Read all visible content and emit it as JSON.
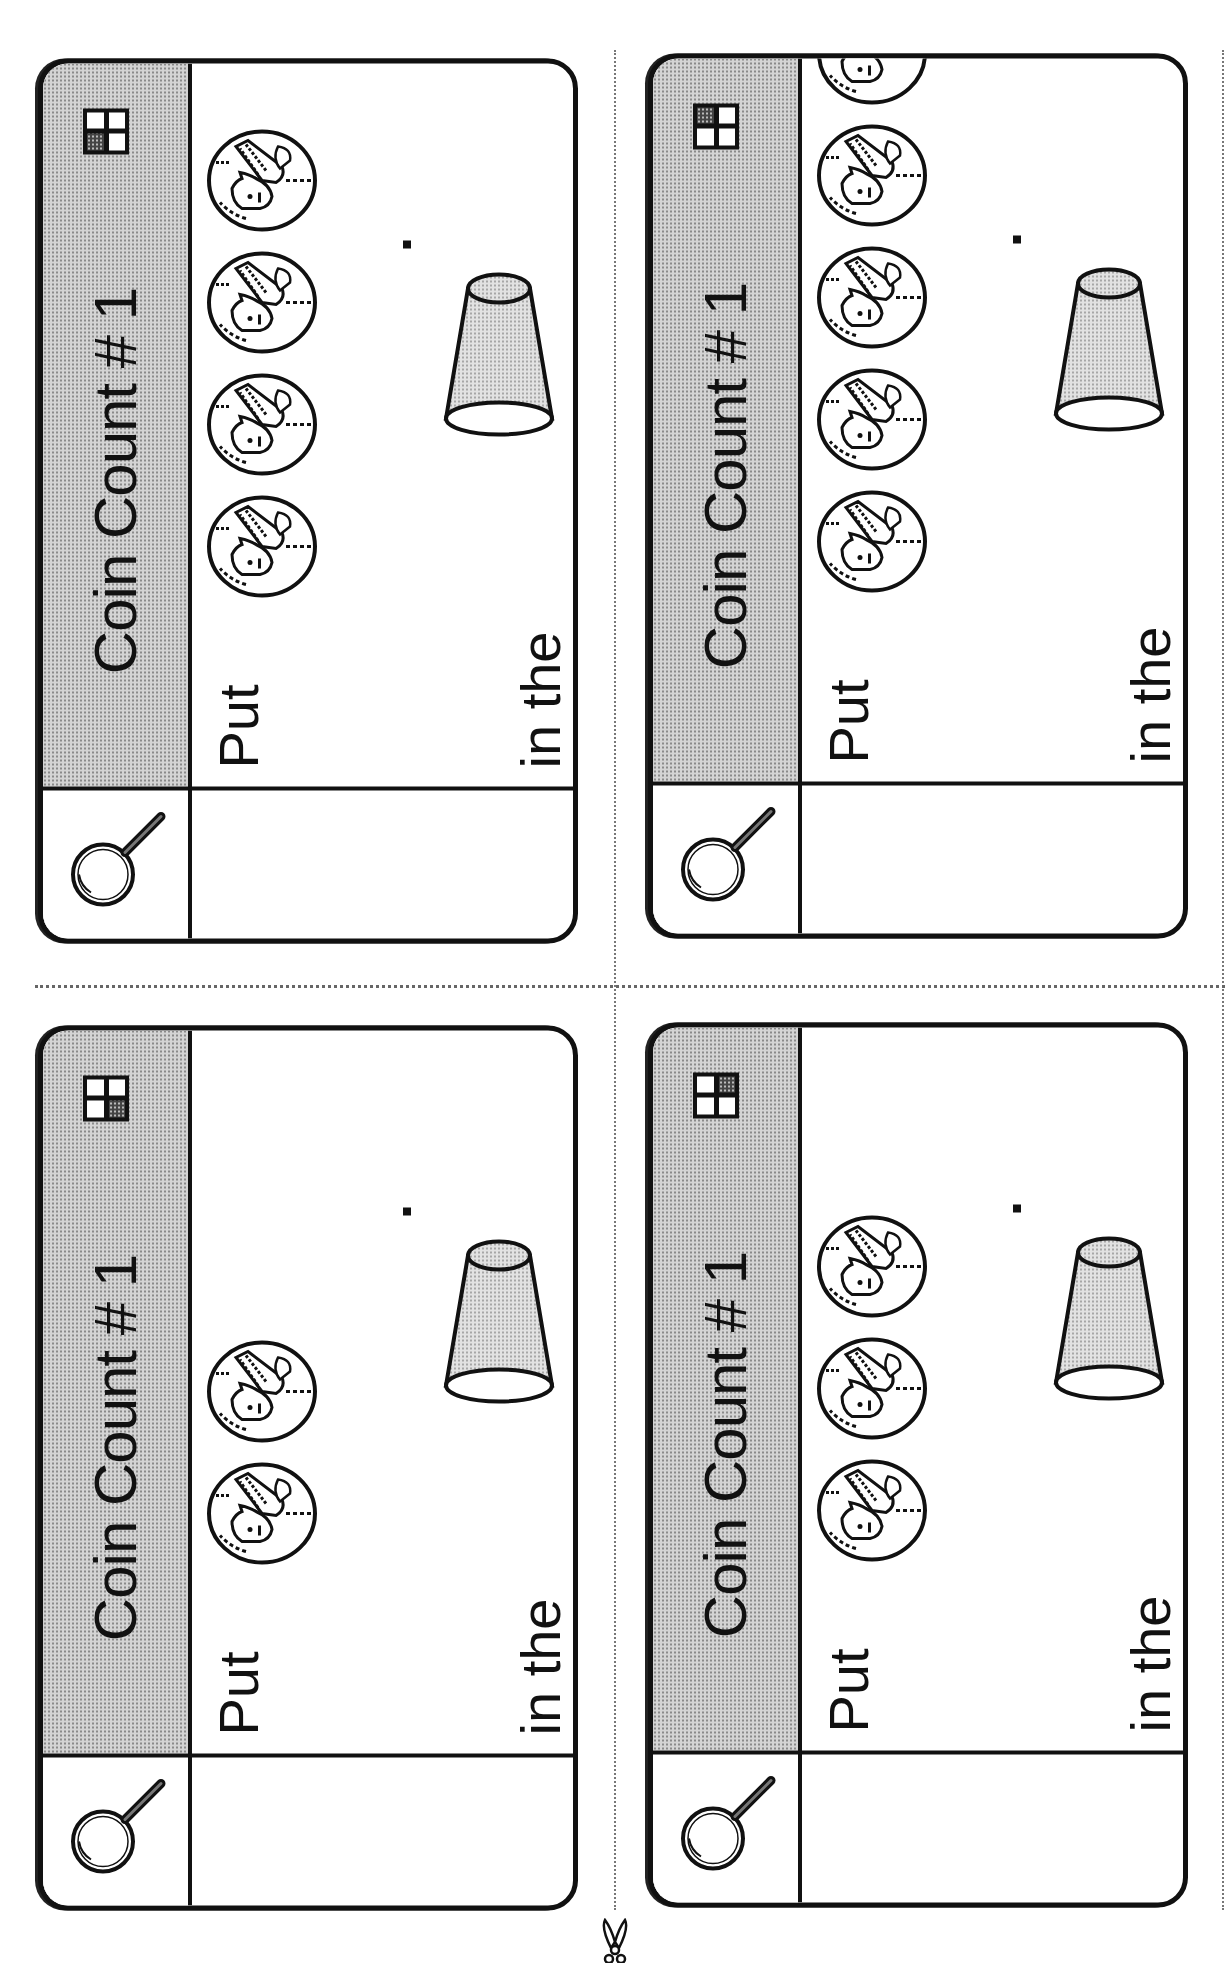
{
  "worksheet": {
    "cards": [
      {
        "title": "Coin Count # 1",
        "prompt_start": "Put",
        "prompt_end": "in the",
        "period": ".",
        "coin_count": 4,
        "quadrant_shaded": "top-left",
        "coin_type": "penny",
        "container": "cup"
      },
      {
        "title": "Coin Count # 1",
        "prompt_start": "Put",
        "prompt_end": "in the",
        "period": ".",
        "coin_count": 5,
        "quadrant_shaded": "top-right",
        "coin_type": "penny",
        "container": "cup"
      },
      {
        "title": "Coin Count # 1",
        "prompt_start": "Put",
        "prompt_end": "in the",
        "period": ".",
        "coin_count": 2,
        "quadrant_shaded": "bottom-left",
        "coin_type": "penny",
        "container": "cup"
      },
      {
        "title": "Coin Count # 1",
        "prompt_start": "Put",
        "prompt_end": "in the",
        "period": ".",
        "coin_count": 3,
        "quadrant_shaded": "bottom-right",
        "coin_type": "penny",
        "container": "cup"
      }
    ],
    "icons": {
      "header_icon": "magnifying-glass-icon",
      "coin_icon": "penny-icon",
      "cup_icon": "cup-icon",
      "cut_icon": "scissors-icon"
    },
    "colors": {
      "ink": "#111111",
      "header_fill": "#d4d4d4",
      "background": "#ffffff"
    }
  }
}
